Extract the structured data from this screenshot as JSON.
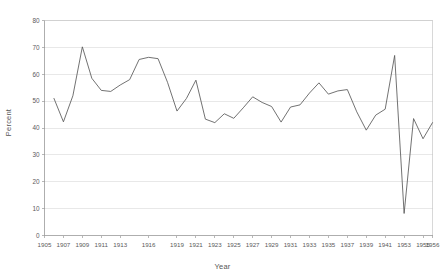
{
  "chart_data": {
    "type": "line",
    "title": "",
    "xlabel": "Year",
    "ylabel": "Percent",
    "grid": true,
    "legend": false,
    "xlim": [
      1905,
      1956
    ],
    "ylim": [
      0,
      80
    ],
    "ytick_step": 10,
    "yticks": [
      0,
      10,
      20,
      30,
      40,
      50,
      60,
      70,
      80
    ],
    "xtick_labels": [
      "1905",
      "1907",
      "1909",
      "1911",
      "1913",
      "1916",
      "1919",
      "1921",
      "1923",
      "1925",
      "1927",
      "1929",
      "1931",
      "1933",
      "1935",
      "1937",
      "1939",
      "1941",
      "1953",
      "1955",
      "1956"
    ],
    "line_color": "#595959",
    "grid_color": "#d9d9d9",
    "axis_color": "#9a9a9a",
    "background": "#ffffff",
    "series": [
      {
        "name": "Percent",
        "x": [
          1906,
          1907,
          1908,
          1909,
          1910,
          1911,
          1912,
          1913,
          1914,
          1915,
          1916,
          1917,
          1918,
          1919,
          1920,
          1921,
          1922,
          1923,
          1924,
          1925,
          1926,
          1927,
          1928,
          1929,
          1930,
          1931,
          1932,
          1933,
          1934,
          1935,
          1936,
          1937,
          1938,
          1939,
          1940,
          1941,
          1942
        ],
        "values": [
          51.0,
          42.3,
          52.0,
          70.2,
          58.5,
          54.0,
          53.6,
          56.0,
          58.0,
          65.5,
          66.3,
          65.8,
          57.0,
          46.3,
          51.0,
          57.8,
          43.3,
          42.0,
          45.3,
          43.6,
          47.5,
          51.6,
          49.5,
          48.0,
          42.2,
          47.8,
          48.6,
          53.0,
          56.8,
          52.6,
          53.8,
          54.3,
          46.0,
          43.0,
          41.0,
          40.0,
          39.2
        ]
      },
      {
        "name": "Percent (continued)",
        "x": [
          1939,
          1940,
          1941,
          1942,
          1953,
          1954,
          1955,
          1956
        ],
        "values": [
          39.2,
          44.8,
          47.0,
          67.0,
          8.2,
          43.5,
          36.0,
          42.0
        ]
      }
    ]
  },
  "axes": {
    "y_title": "Percent",
    "x_title": "Year"
  }
}
